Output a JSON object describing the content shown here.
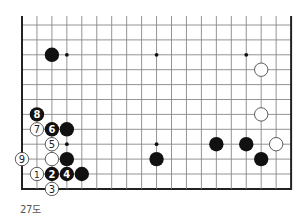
{
  "diagram": {
    "type": "go-board-fragment",
    "caption": "27도",
    "grid": {
      "cols": 19,
      "rows": 12,
      "origin_x": 22,
      "origin_y": 25,
      "spacing_x": 14.95,
      "spacing_y": 14.9,
      "top_extension": 9,
      "open_edges": [
        "top"
      ],
      "line_color": "#888888",
      "edge_color": "#222222"
    },
    "star_points": [
      {
        "col": 3,
        "row": 2
      },
      {
        "col": 9,
        "row": 2
      },
      {
        "col": 15,
        "row": 2
      },
      {
        "col": 3,
        "row": 8
      },
      {
        "col": 9,
        "row": 8
      }
    ],
    "stones": [
      {
        "color": "black",
        "col": 2,
        "row": 2,
        "label": ""
      },
      {
        "color": "white",
        "col": 16,
        "row": 3,
        "label": ""
      },
      {
        "color": "white",
        "col": 16,
        "row": 6,
        "label": ""
      },
      {
        "color": "black",
        "col": 1,
        "row": 6,
        "label": "8"
      },
      {
        "color": "white",
        "col": 1,
        "row": 7,
        "label": "7"
      },
      {
        "color": "black",
        "col": 2,
        "row": 7,
        "label": "6"
      },
      {
        "color": "black",
        "col": 3,
        "row": 7,
        "label": ""
      },
      {
        "color": "white",
        "col": 2,
        "row": 8,
        "label": "5"
      },
      {
        "color": "black",
        "col": 13,
        "row": 8,
        "label": ""
      },
      {
        "color": "black",
        "col": 15,
        "row": 8,
        "label": ""
      },
      {
        "color": "white",
        "col": 17,
        "row": 8,
        "label": ""
      },
      {
        "color": "white",
        "col": 0,
        "row": 9,
        "label": "9"
      },
      {
        "color": "white",
        "col": 2,
        "row": 9,
        "label": ""
      },
      {
        "color": "black",
        "col": 3,
        "row": 9,
        "label": ""
      },
      {
        "color": "black",
        "col": 9,
        "row": 9,
        "label": ""
      },
      {
        "color": "black",
        "col": 16,
        "row": 9,
        "label": ""
      },
      {
        "color": "white",
        "col": 1,
        "row": 10,
        "label": "1"
      },
      {
        "color": "black",
        "col": 2,
        "row": 10,
        "label": "2"
      },
      {
        "color": "black",
        "col": 3,
        "row": 10,
        "label": "4"
      },
      {
        "color": "black",
        "col": 4,
        "row": 10,
        "label": ""
      },
      {
        "color": "white",
        "col": 2,
        "row": 11,
        "label": "3"
      }
    ],
    "colors": {
      "black_stone": "#111111",
      "white_stone": "#ffffff",
      "white_stone_stroke": "#333333",
      "label_on_black": "#ffffff",
      "label_on_white": "#222222"
    }
  }
}
